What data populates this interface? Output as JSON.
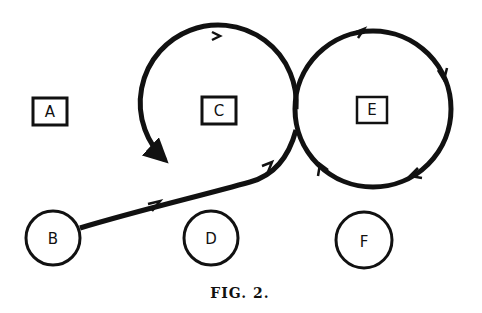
{
  "figure": {
    "caption": "FIG. 2.",
    "ink_color": "#111111",
    "background": "#ffffff"
  },
  "nodes": {
    "A": {
      "label": "A",
      "shape": "square"
    },
    "C": {
      "label": "C",
      "shape": "square"
    },
    "E": {
      "label": "E",
      "shape": "square"
    },
    "B": {
      "label": "B",
      "shape": "circle"
    },
    "D": {
      "label": "D",
      "shape": "circle"
    },
    "F": {
      "label": "F",
      "shape": "circle"
    }
  },
  "paths": [
    {
      "name": "B to crossing",
      "description": "curved line from B rising to the crossing point between C and E loops"
    },
    {
      "name": "loop around E",
      "description": "clockwise loop around E"
    },
    {
      "name": "loop around C",
      "description": "loop around C ending in an arrowhead at lower-left of C"
    }
  ]
}
